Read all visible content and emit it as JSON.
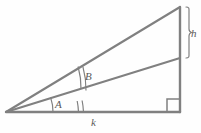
{
  "figure": {
    "type": "geometry-diagram",
    "background_color": "#fefefe",
    "stroke_color": "#808080",
    "label_color": "#5a5a5a",
    "labels": {
      "angle_lower": "A",
      "angle_upper": "B",
      "base": "k",
      "height_segment": "h"
    },
    "points": {
      "apex_left": {
        "x": 6,
        "y": 112
      },
      "corner_bottom_right": {
        "x": 180,
        "y": 112
      },
      "corner_top_right": {
        "x": 180,
        "y": 7
      },
      "point_mid_right": {
        "x": 180,
        "y": 58
      }
    },
    "segments": [
      {
        "name": "base-line",
        "from": "apex_left",
        "to": "corner_bottom_right"
      },
      {
        "name": "vertical-line",
        "from": "corner_bottom_right",
        "to": "corner_top_right"
      },
      {
        "name": "hypotenuse-upper",
        "from": "apex_left",
        "to": "corner_top_right"
      },
      {
        "name": "cevian-line",
        "from": "apex_left",
        "to": "point_mid_right"
      }
    ],
    "markers": {
      "right_angle": "right-angle-square",
      "angle_A_arcs": 1,
      "angle_B_arcs": 2,
      "h_brace": "right-curly-brace"
    }
  }
}
